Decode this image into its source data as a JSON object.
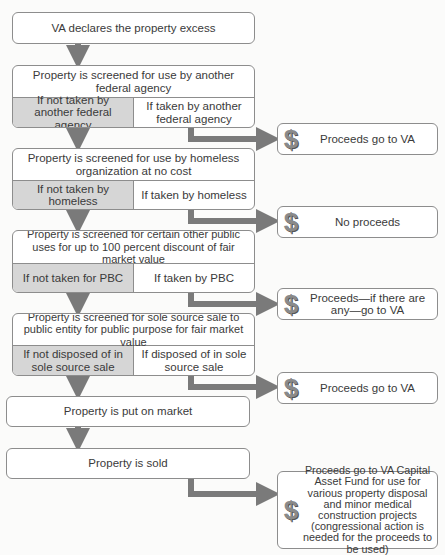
{
  "flow": {
    "step1": "VA declares the property excess",
    "step2": {
      "title": "Property is screened for use by another federal agency",
      "no": "If not taken by another federal agency",
      "yes": "If taken by another federal agency"
    },
    "step3": {
      "title": "Property is screened for use by homeless organization at no cost",
      "no": "If not taken by homeless",
      "yes": "If taken by homeless"
    },
    "step4": {
      "title": "Property is screened for certain other public uses for up to 100 percent discount of fair market value",
      "no": "If not taken for PBC",
      "yes": "If taken by PBC"
    },
    "step5": {
      "title": "Property is screened for sole source sale to public entity for public purpose for fair market value",
      "no": "If not disposed of in sole source sale",
      "yes": "If disposed of in sole source sale"
    },
    "step6": "Property is put on market",
    "step7": "Property is sold"
  },
  "outcomes": [
    {
      "icon": "dollar-icon",
      "symbol": "$",
      "text": "Proceeds go to VA"
    },
    {
      "icon": "dollar-icon",
      "symbol": "$",
      "text": "No proceeds"
    },
    {
      "icon": "dollar-icon",
      "symbol": "$",
      "text": "Proceeds—if there are any—go to VA"
    },
    {
      "icon": "dollar-icon",
      "symbol": "$",
      "text": "Proceeds go to VA"
    },
    {
      "icon": "dollar-icon",
      "symbol": "$",
      "text": "Proceeds go to VA Capital Asset Fund for use for various property disposal and minor medical construction projects (congressional action is needed for the proceeds to be used)"
    }
  ],
  "colors": {
    "border": "#8d8d8d",
    "no_cell_fill": "#d6d6d6",
    "arrow": "#7a7a7a"
  }
}
